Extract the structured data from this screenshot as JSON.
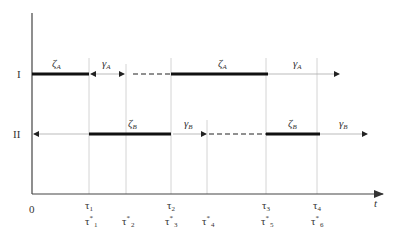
{
  "diagram": {
    "rows": [
      {
        "label": "I",
        "y": 74
      },
      {
        "label": "II",
        "y": 134
      }
    ],
    "axis": {
      "origin_label": "0",
      "x_label": "t"
    },
    "ticks": [
      {
        "x": 89,
        "top": "τ",
        "top_sub": "1",
        "bottom": "τ",
        "bottom_sup": "*",
        "bottom_sub": "1"
      },
      {
        "x": 126,
        "top": "",
        "top_sub": "",
        "bottom": "τ",
        "bottom_sup": "*",
        "bottom_sub": "2"
      },
      {
        "x": 171,
        "top": "τ",
        "top_sub": "2",
        "bottom": "τ",
        "bottom_sup": "*",
        "bottom_sub": "3"
      },
      {
        "x": 207,
        "top": "",
        "top_sub": "",
        "bottom": "τ",
        "bottom_sup": "*",
        "bottom_sub": "4"
      },
      {
        "x": 266,
        "top": "τ",
        "top_sub": "3",
        "bottom": "τ",
        "bottom_sup": "*",
        "bottom_sub": "5"
      },
      {
        "x": 317,
        "top": "τ",
        "top_sub": "4",
        "bottom": "τ",
        "bottom_sup": "*",
        "bottom_sub": "6"
      }
    ],
    "segment_labels": {
      "row1": [
        {
          "sym": "ζ",
          "sub": "A",
          "x": 56
        },
        {
          "sym": "γ",
          "sub": "A",
          "x": 106
        },
        {
          "sym": "ζ",
          "sub": "A",
          "x": 222
        },
        {
          "sym": "γ",
          "sub": "A",
          "x": 297
        }
      ],
      "row2": [
        {
          "sym": "ζ",
          "sub": "B",
          "x": 132
        },
        {
          "sym": "γ",
          "sub": "B",
          "x": 188
        },
        {
          "sym": "ζ",
          "sub": "B",
          "x": 292
        },
        {
          "sym": "γ",
          "sub": "B",
          "x": 343
        }
      ]
    },
    "colors": {
      "thick": "#111111",
      "thin": "#9a9a9a",
      "grid": "#cfcfcf",
      "axis": "#444444"
    }
  }
}
